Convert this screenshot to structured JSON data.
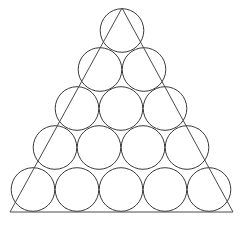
{
  "figure": {
    "canvas": {
      "width": 244,
      "height": 226,
      "background": "#ffffff"
    },
    "stroke": {
      "color": "#3a3a3a",
      "triangle_color": "#4a4a4a",
      "width": 1.0,
      "triangle_width": 1.0
    },
    "triangle": {
      "name": "outer-triangle",
      "apex": {
        "x": 122,
        "y": 8
      },
      "bottom_left": {
        "x": 10,
        "y": 212
      },
      "bottom_right": {
        "x": 233,
        "y": 212
      },
      "points": "122,8 10,212 233,212"
    },
    "packing": {
      "rows": 5,
      "circle_count": 15,
      "radius": 22,
      "row_spacing": 39,
      "column_spacing": 44,
      "row_counts": [
        1,
        2,
        3,
        4,
        5
      ]
    },
    "circles": [
      {
        "id": "circle-r1-c1",
        "row": 1,
        "col": 1,
        "cx": 122,
        "cy": 30.5,
        "r": 21.8
      },
      {
        "id": "circle-r2-c1",
        "row": 2,
        "col": 1,
        "cx": 100,
        "cy": 69.5,
        "r": 21.8
      },
      {
        "id": "circle-r2-c2",
        "row": 2,
        "col": 2,
        "cx": 144,
        "cy": 69.5,
        "r": 21.8
      },
      {
        "id": "circle-r3-c1",
        "row": 3,
        "col": 1,
        "cx": 77,
        "cy": 108.5,
        "r": 21.8
      },
      {
        "id": "circle-r3-c2",
        "row": 3,
        "col": 2,
        "cx": 121,
        "cy": 108.5,
        "r": 21.8
      },
      {
        "id": "circle-r3-c3",
        "row": 3,
        "col": 3,
        "cx": 165,
        "cy": 108.5,
        "r": 21.8
      },
      {
        "id": "circle-r4-c1",
        "row": 4,
        "col": 1,
        "cx": 55,
        "cy": 147.5,
        "r": 21.8
      },
      {
        "id": "circle-r4-c2",
        "row": 4,
        "col": 2,
        "cx": 99,
        "cy": 147.5,
        "r": 21.8
      },
      {
        "id": "circle-r4-c3",
        "row": 4,
        "col": 3,
        "cx": 143,
        "cy": 147.5,
        "r": 21.8
      },
      {
        "id": "circle-r4-c4",
        "row": 4,
        "col": 4,
        "cx": 187,
        "cy": 147.5,
        "r": 21.8
      },
      {
        "id": "circle-r5-c1",
        "row": 5,
        "col": 1,
        "cx": 33,
        "cy": 189.5,
        "r": 21.8
      },
      {
        "id": "circle-r5-c2",
        "row": 5,
        "col": 2,
        "cx": 77,
        "cy": 189.5,
        "r": 21.8
      },
      {
        "id": "circle-r5-c3",
        "row": 5,
        "col": 3,
        "cx": 121,
        "cy": 189.5,
        "r": 21.8
      },
      {
        "id": "circle-r5-c4",
        "row": 5,
        "col": 4,
        "cx": 165,
        "cy": 189.5,
        "r": 21.8
      },
      {
        "id": "circle-r5-c5",
        "row": 5,
        "col": 5,
        "cx": 209,
        "cy": 189.5,
        "r": 21.8
      }
    ]
  }
}
